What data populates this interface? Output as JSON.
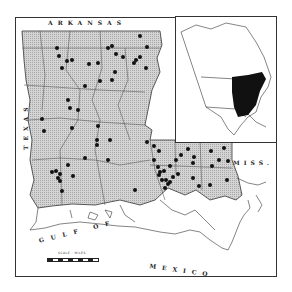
{
  "map": {
    "type": "distribution map",
    "region": "Louisiana",
    "labels": {
      "north": "ARKANSAS",
      "west": "TEXAS",
      "east": "MISS.",
      "south_gulf_1": "GULF OF",
      "south_gulf_2": "MEXICO"
    },
    "scale": {
      "label": "SCALE · MILES"
    },
    "inset": {
      "region": "North America",
      "highlight": "Eastern North America range (black fill)"
    },
    "colors": {
      "land_fill": "#c8c8c8",
      "water": "#ffffff",
      "border": "#333333",
      "record_dot": "#111111",
      "range_fill": "#111111"
    },
    "records": [
      [
        57,
        48
      ],
      [
        59,
        56
      ],
      [
        57,
        50
      ],
      [
        67,
        61
      ],
      [
        62,
        68
      ],
      [
        72,
        60
      ],
      [
        98,
        63
      ],
      [
        85,
        86
      ],
      [
        89,
        64
      ],
      [
        100,
        81
      ],
      [
        108,
        48
      ],
      [
        110,
        46
      ],
      [
        116,
        54
      ],
      [
        123,
        57
      ],
      [
        134,
        63
      ],
      [
        136,
        60
      ],
      [
        140,
        57
      ],
      [
        115,
        72
      ],
      [
        140,
        36
      ],
      [
        147,
        47
      ],
      [
        146,
        68
      ],
      [
        68,
        100
      ],
      [
        70,
        108
      ],
      [
        78,
        110
      ],
      [
        42,
        119
      ],
      [
        44,
        131
      ],
      [
        72,
        128
      ],
      [
        98,
        126
      ],
      [
        97,
        140
      ],
      [
        97,
        145
      ],
      [
        96,
        137
      ],
      [
        112,
        80
      ],
      [
        109,
        58
      ],
      [
        85,
        158
      ],
      [
        85,
        165
      ],
      [
        68,
        165
      ],
      [
        108,
        160
      ],
      [
        52,
        172
      ],
      [
        54,
        175
      ],
      [
        56,
        171
      ],
      [
        58,
        178
      ],
      [
        60,
        174
      ],
      [
        60,
        181
      ],
      [
        73,
        176
      ],
      [
        62,
        191
      ],
      [
        95,
        155
      ],
      [
        110,
        140
      ],
      [
        135,
        190
      ],
      [
        138,
        197
      ],
      [
        147,
        142
      ],
      [
        154,
        146
      ],
      [
        154,
        160
      ],
      [
        159,
        151
      ],
      [
        158,
        167
      ],
      [
        160,
        172
      ],
      [
        164,
        171
      ],
      [
        159,
        175
      ],
      [
        162,
        180
      ],
      [
        166,
        180
      ],
      [
        165,
        188
      ],
      [
        168,
        192
      ],
      [
        162,
        185
      ],
      [
        170,
        182
      ],
      [
        173,
        177
      ],
      [
        178,
        174
      ],
      [
        172,
        185
      ],
      [
        181,
        155
      ],
      [
        188,
        149
      ],
      [
        194,
        157
      ],
      [
        193,
        163
      ],
      [
        193,
        178
      ],
      [
        199,
        186
      ],
      [
        210,
        185
      ],
      [
        212,
        166
      ],
      [
        211,
        151
      ],
      [
        219,
        160
      ],
      [
        224,
        148
      ],
      [
        228,
        161
      ],
      [
        227,
        180
      ],
      [
        227,
        190
      ],
      [
        214,
        138
      ],
      [
        230,
        141
      ],
      [
        170,
        166
      ],
      [
        176,
        160
      ]
    ]
  }
}
